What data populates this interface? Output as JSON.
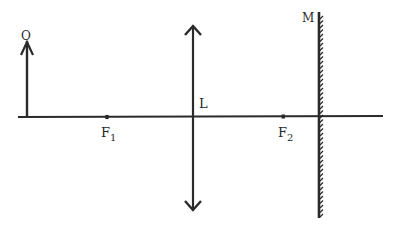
{
  "diagram": {
    "type": "optics-ray-diagram",
    "colors": {
      "line": "#2a2a2a",
      "background": "#ffffff"
    },
    "labels": {
      "object": "O",
      "lens": "L",
      "focus1_main": "F",
      "focus1_sub": "1",
      "focus2_main": "F",
      "focus2_sub": "2",
      "mirror": "M"
    },
    "elements": {
      "optical_axis": {
        "x1": 18,
        "x2": 383,
        "y": 117
      },
      "object_arrow": {
        "x": 27,
        "y_base": 117,
        "y_tip": 40
      },
      "lens": {
        "x": 193,
        "y_top": 26,
        "y_bottom": 210,
        "kind": "converging"
      },
      "focus1": {
        "x": 107,
        "y": 117
      },
      "focus2": {
        "x": 283,
        "y": 116
      },
      "mirror": {
        "x": 319,
        "y_top": 12,
        "y_bottom": 218,
        "kind": "plane",
        "hatch_side": "right"
      }
    }
  }
}
